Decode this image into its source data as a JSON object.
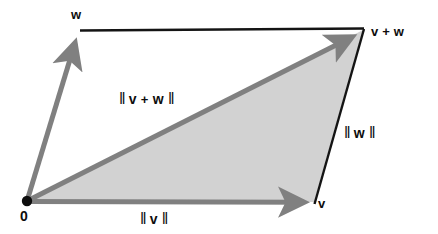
{
  "figure": {
    "background_color": "#ffffff",
    "width": 438,
    "height": 234,
    "colors": {
      "vector_gray": "#808080",
      "outline_black": "#141414",
      "triangle_fill": "#d2d2d2",
      "text_black": "#0d0d0d"
    },
    "labels": {
      "w": "w",
      "v": "v",
      "v_plus_w": "v + w",
      "origin": "0",
      "norm_v_plus_w_open": "‖",
      "norm_v_plus_w_text": "v",
      "norm_v_plus_w_plus": "+",
      "norm_v_plus_w_text2": "w",
      "norm_v_plus_w_close": "‖",
      "norm_w_open": "‖",
      "norm_w_text": "w",
      "norm_w_close": "‖",
      "norm_v_open": "‖",
      "norm_v_text": "v",
      "norm_v_close": "‖"
    },
    "geometry": {
      "origin": {
        "x": 27,
        "y": 201
      },
      "point_v": {
        "x": 314,
        "y": 202
      },
      "point_w": {
        "x": 80,
        "y": 31
      },
      "point_v_plus_w": {
        "x": 363,
        "y": 30
      },
      "origin_dot_radius": 5,
      "vector_stroke_width": 5,
      "outline_stroke_width": 2
    },
    "elements": {
      "vector_v_name": "vector-v",
      "vector_w_name": "vector-w",
      "vector_sum_name": "vector-v-plus-w",
      "triangle_name": "shaded-triangle",
      "edge_top_name": "parallelogram-top-edge",
      "edge_right_name": "parallelogram-right-edge"
    }
  }
}
